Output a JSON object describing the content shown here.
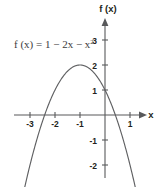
{
  "chart_data": {
    "type": "line",
    "title": "",
    "xlabel": "x",
    "ylabel": "f (x)",
    "equation_label": "f (x) = 1 − 2x − x",
    "equation_exponent": "2",
    "function": "f(x) = 1 - 2x - x^2",
    "xlim": [
      -3.6,
      1.6
    ],
    "ylim": [
      -2.4,
      3.3
    ],
    "grid": false,
    "legend": null,
    "x_ticks": [
      -3,
      -2,
      -1,
      1
    ],
    "x_tick_labels": [
      "-3",
      "-2",
      "-1",
      "1"
    ],
    "y_ticks": [
      3,
      2,
      1,
      -1,
      -2
    ],
    "y_tick_labels": [
      "3",
      "2",
      "1",
      "-1",
      "-2"
    ],
    "vertex": [
      -1,
      2
    ],
    "y_intercept": [
      0,
      1
    ],
    "roots": [
      -2.414,
      0.414
    ],
    "x": [
      -3.3,
      -3.0,
      -2.75,
      -2.5,
      -2.414,
      -2.25,
      -2.0,
      -1.75,
      -1.5,
      -1.25,
      -1.0,
      -0.75,
      -0.5,
      -0.25,
      0.0,
      0.25,
      0.414,
      0.5,
      0.75,
      1.0,
      1.25,
      1.5
    ],
    "values": [
      -3.29,
      -2.0,
      -1.0625,
      -0.25,
      0.0,
      0.4375,
      1.0,
      1.4375,
      1.75,
      1.9375,
      2.0,
      1.9375,
      1.75,
      1.4375,
      1.0,
      0.4375,
      0.0,
      -0.25,
      -1.0625,
      -2.0,
      -3.0625,
      -4.25
    ]
  },
  "axes": {
    "x_axis_label": "x",
    "y_axis_label": "f (x)"
  }
}
